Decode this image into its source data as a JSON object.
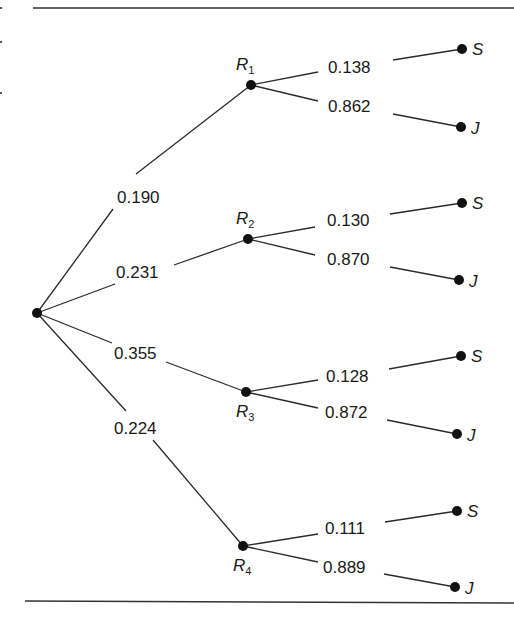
{
  "diagram": {
    "type": "probability-tree",
    "root": {
      "label": ""
    },
    "branches": [
      {
        "node": "R",
        "subscript": "1",
        "probability": "0.190",
        "children": [
          {
            "outcome": "S",
            "probability": "0.138"
          },
          {
            "outcome": "J",
            "probability": "0.862"
          }
        ]
      },
      {
        "node": "R",
        "subscript": "2",
        "probability": "0.231",
        "children": [
          {
            "outcome": "S",
            "probability": "0.130"
          },
          {
            "outcome": "J",
            "probability": "0.870"
          }
        ]
      },
      {
        "node": "R",
        "subscript": "3",
        "probability": "0.355",
        "children": [
          {
            "outcome": "S",
            "probability": "0.128"
          },
          {
            "outcome": "J",
            "probability": "0.872"
          }
        ]
      },
      {
        "node": "R",
        "subscript": "4",
        "probability": "0.224",
        "children": [
          {
            "outcome": "S",
            "probability": "0.111"
          },
          {
            "outcome": "J",
            "probability": "0.889"
          }
        ]
      }
    ]
  }
}
